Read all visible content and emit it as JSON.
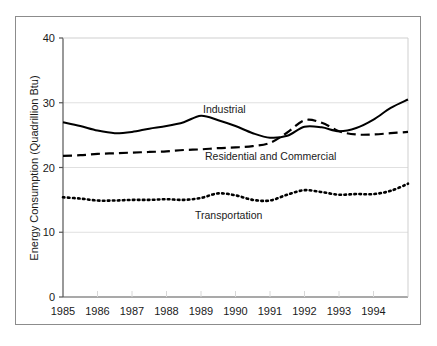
{
  "chart_data": {
    "type": "line",
    "title": "",
    "xlabel": "",
    "ylabel": "Energy Consumption (Quadrillion Btu)",
    "xlim": [
      1985,
      1995
    ],
    "ylim": [
      0,
      40
    ],
    "yticks": [
      0,
      10,
      20,
      30,
      40
    ],
    "ytick_labels": [
      "0",
      "10",
      "20",
      "30",
      "40"
    ],
    "xticks": [
      1985,
      1986,
      1987,
      1988,
      1989,
      1990,
      1991,
      1992,
      1993,
      1994
    ],
    "xtick_labels": [
      "1985",
      "1986",
      "1987",
      "1988",
      "1989",
      "1990",
      "1991",
      "1992",
      "1993",
      "1994"
    ],
    "grid": "horizontal-light",
    "legend_position": "inline-annotations",
    "x": [
      1985.0,
      1985.5,
      1986.0,
      1986.5,
      1987.0,
      1987.5,
      1988.0,
      1988.5,
      1989.0,
      1989.5,
      1990.0,
      1990.5,
      1991.0,
      1991.5,
      1992.0,
      1992.5,
      1993.0,
      1993.5,
      1994.0,
      1994.5,
      1995.0
    ],
    "series": [
      {
        "name": "Industrial",
        "style": "solid",
        "color": "#000000",
        "values": [
          27.0,
          26.4,
          25.7,
          25.3,
          25.5,
          26.0,
          26.4,
          27.0,
          28.0,
          27.3,
          26.4,
          25.3,
          24.6,
          24.9,
          26.3,
          26.2,
          25.6,
          26.1,
          27.4,
          29.2,
          30.5
        ]
      },
      {
        "name": "Residential and Commercial",
        "style": "dashed",
        "color": "#000000",
        "values": [
          21.8,
          21.9,
          22.1,
          22.2,
          22.3,
          22.4,
          22.5,
          22.7,
          22.8,
          23.0,
          23.1,
          23.3,
          23.8,
          25.4,
          27.3,
          26.9,
          25.6,
          25.1,
          25.1,
          25.3,
          25.5
        ]
      },
      {
        "name": "Transportation",
        "style": "dotted",
        "color": "#000000",
        "values": [
          15.4,
          15.2,
          14.9,
          14.9,
          15.0,
          15.0,
          15.1,
          15.0,
          15.3,
          16.0,
          15.7,
          15.0,
          14.9,
          15.8,
          16.5,
          16.2,
          15.8,
          15.9,
          15.9,
          16.4,
          17.5
        ]
      }
    ],
    "annotations": [
      {
        "text": "Industrial",
        "x_px": 203,
        "y_px": 113
      },
      {
        "text": "Residential and Commercial",
        "x_px": 205,
        "y_px": 160
      },
      {
        "text": "Transportation",
        "x_px": 195,
        "y_px": 219
      }
    ]
  },
  "colors": {
    "background": "#ffffff",
    "frame": "#8c8c8c",
    "axis": "#555555",
    "gridline": "#e0e0e0",
    "text": "#1a1a1a",
    "line": "#000000"
  }
}
